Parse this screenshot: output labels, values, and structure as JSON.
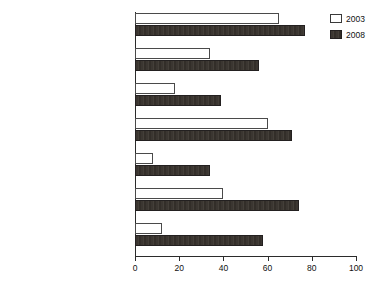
{
  "chart_data": {
    "type": "bar",
    "orientation": "horizontal",
    "title": "",
    "subtitle": "",
    "xlabel": "",
    "ylabel": "",
    "xlim": [
      0,
      100
    ],
    "xticks": [
      0,
      20,
      40,
      60,
      80,
      100
    ],
    "grid": false,
    "legend_position": "top-right",
    "categories": [
      "Transaction data",
      "Demographics",
      "Lifestyle",
      "Received outbound campaigns",
      "Share of wallet",
      "Customer initiated interactions",
      "Customer satisfaction"
    ],
    "series": [
      {
        "name": "2003",
        "color": "#ffffff",
        "edge_color": "#4a4a4a",
        "values": [
          65,
          34,
          18,
          60,
          8,
          40,
          12
        ]
      },
      {
        "name": "2008",
        "color": "#3b3631",
        "edge_color": "#232020",
        "values": [
          77,
          56,
          39,
          71,
          34,
          74,
          58
        ]
      }
    ]
  },
  "legend": {
    "entries": [
      {
        "label": "2003",
        "swatch": "hollow-square-icon"
      },
      {
        "label": "2008",
        "swatch": "filled-square-icon"
      }
    ]
  },
  "axis": {
    "tick_labels": [
      "0",
      "20",
      "40",
      "60",
      "80",
      "100"
    ]
  }
}
